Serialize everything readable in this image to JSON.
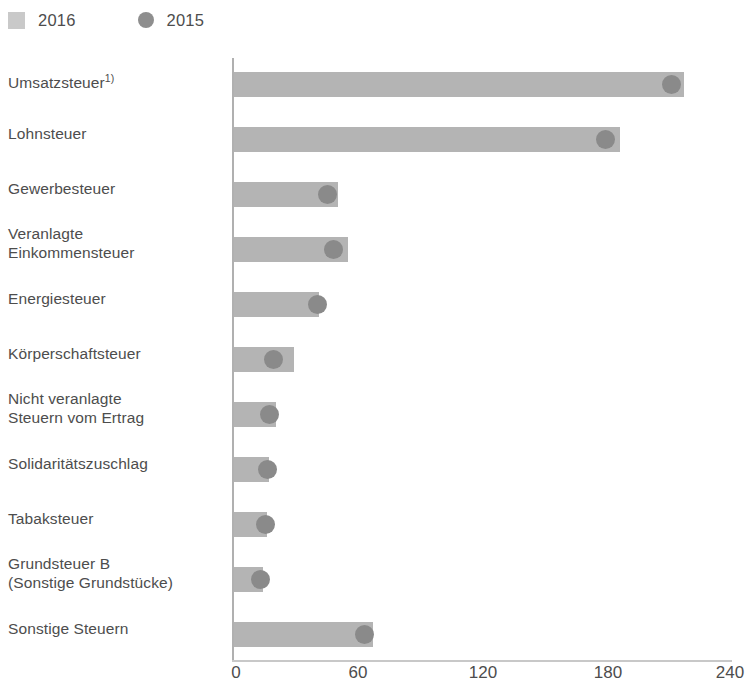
{
  "legend": {
    "position": "top-left",
    "items": [
      {
        "label": "2016",
        "marker": "square-icon",
        "color": "#c9c9c9"
      },
      {
        "label": "2015",
        "marker": "circle-icon",
        "color": "#8e8e8e"
      }
    ]
  },
  "axis": {
    "x_ticks": [
      "0",
      "60",
      "120",
      "180",
      "240"
    ],
    "x_min": 0,
    "x_max": 240
  },
  "chart_data": {
    "type": "bar",
    "orientation": "horizontal",
    "title": "",
    "subtitle": "",
    "xlabel": "",
    "ylabel": "",
    "xlim": [
      0,
      240
    ],
    "ylim": null,
    "grid": false,
    "legend_position": "top-left",
    "categories": [
      "Umsatzsteuer",
      "Lohnsteuer",
      "Gewerbesteuer",
      "Veranlagte Einkommensteuer",
      "Energiesteuer",
      "Körperschaftsteuer",
      "Nicht veranlagte Steuern vom Ertrag",
      "Solidaritätszuschlag",
      "Tabaksteuer",
      "Grundsteuer B (Sonstige Grundstücke)",
      "Sonstige Steuern"
    ],
    "series": [
      {
        "name": "2016",
        "marker": "bar",
        "color": "#b4b4b4",
        "values": [
          217,
          186,
          50,
          55,
          41,
          29,
          20,
          17,
          16,
          14,
          67
        ]
      },
      {
        "name": "2015",
        "marker": "dot",
        "color": "#8a8a8a",
        "values": [
          211,
          179,
          45,
          48,
          40,
          19,
          17,
          16,
          15,
          13,
          63
        ]
      }
    ],
    "annotations": [
      "1)"
    ]
  },
  "rows": [
    {
      "label_line1": "Umsatzsteuer",
      "label_line2": "",
      "footnote": "1)",
      "bar_value": 217,
      "dot_value": 211
    },
    {
      "label_line1": "Lohnsteuer",
      "label_line2": "",
      "footnote": "",
      "bar_value": 186,
      "dot_value": 179
    },
    {
      "label_line1": "Gewerbesteuer",
      "label_line2": "",
      "footnote": "",
      "bar_value": 50,
      "dot_value": 45
    },
    {
      "label_line1": "Veranlagte",
      "label_line2": "Einkommensteuer",
      "footnote": "",
      "bar_value": 55,
      "dot_value": 48
    },
    {
      "label_line1": "Energiesteuer",
      "label_line2": "",
      "footnote": "",
      "bar_value": 41,
      "dot_value": 40
    },
    {
      "label_line1": "Körperschaftsteuer",
      "label_line2": "",
      "footnote": "",
      "bar_value": 29,
      "dot_value": 19
    },
    {
      "label_line1": "Nicht veranlagte",
      "label_line2": "Steuern vom Ertrag",
      "footnote": "",
      "bar_value": 20,
      "dot_value": 17
    },
    {
      "label_line1": "Solidaritätszuschlag",
      "label_line2": "",
      "footnote": "",
      "bar_value": 17,
      "dot_value": 16
    },
    {
      "label_line1": "Tabaksteuer",
      "label_line2": "",
      "footnote": "",
      "bar_value": 16,
      "dot_value": 15
    },
    {
      "label_line1": "Grundsteuer B",
      "label_line2": "(Sonstige Grundstücke)",
      "footnote": "",
      "bar_value": 14,
      "dot_value": 13
    },
    {
      "label_line1": "Sonstige Steuern",
      "label_line2": "",
      "footnote": "",
      "bar_value": 67,
      "dot_value": 63
    }
  ]
}
